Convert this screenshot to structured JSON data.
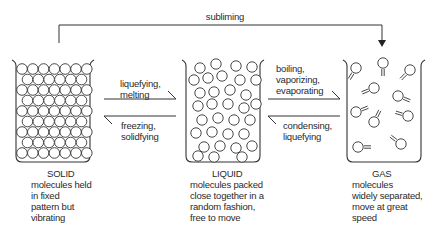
{
  "diagram": {
    "top_arrow": {
      "label": "subliming"
    },
    "states": [
      {
        "name": "SOLID",
        "description": [
          "molecules held",
          "in fixed",
          "pattern but",
          "vibrating"
        ]
      },
      {
        "name": "LIQUID",
        "description": [
          "molecules packed",
          "close together in a",
          "random fashion,",
          "free to move"
        ]
      },
      {
        "name": "GAS",
        "description": [
          "molecules",
          "widely separated,",
          "move at great",
          "speed"
        ]
      }
    ],
    "transitions": {
      "solid_to_liquid": [
        "liquefying,",
        "melting"
      ],
      "liquid_to_solid": [
        "freezing,",
        "solidfying"
      ],
      "liquid_to_gas": [
        "boiling,",
        "vaporizing,",
        "evaporating"
      ],
      "gas_to_liquid": [
        "condensing,",
        "liquefying"
      ]
    },
    "colors": {
      "line": "#333333",
      "background": "#ffffff"
    }
  }
}
